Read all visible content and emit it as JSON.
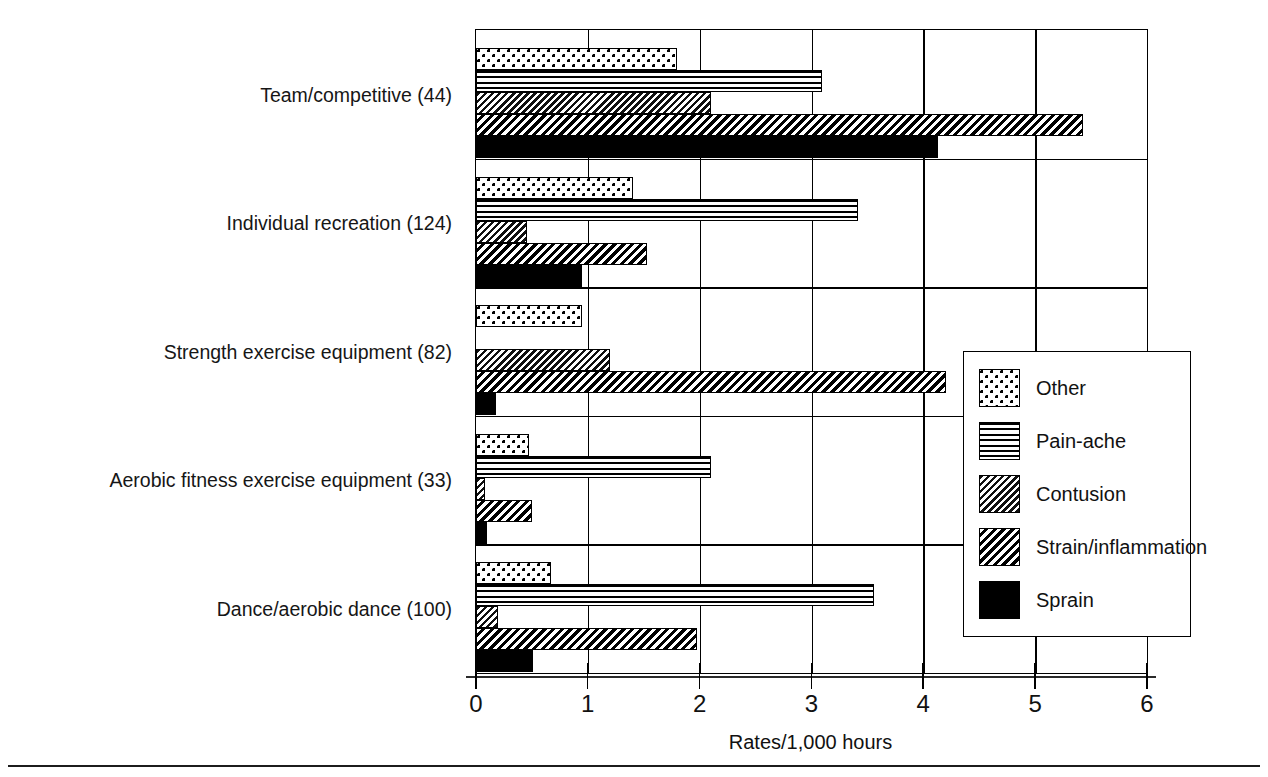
{
  "chart_data": {
    "type": "bar",
    "orientation": "horizontal",
    "title": "",
    "xlabel": "Rates/1,000 hours",
    "ylabel": "",
    "xlim": [
      0,
      6
    ],
    "xticks": [
      "0",
      "1",
      "2",
      "3",
      "4",
      "5",
      "6"
    ],
    "grid": true,
    "legend_position": "right-middle",
    "categories": [
      "Team/competitive (44)",
      "Individual recreation (124)",
      "Strength exercise equipment (82)",
      "Aerobic fitness exercise equipment (33)",
      "Dance/aerobic dance (100)"
    ],
    "series": [
      {
        "name": "Other",
        "pattern": "dots",
        "values": [
          1.8,
          1.4,
          0.95,
          0.47,
          0.67
        ]
      },
      {
        "name": "Pain-ache",
        "pattern": "horizontal-lines",
        "values": [
          3.09,
          3.42,
          0.0,
          2.1,
          3.56
        ]
      },
      {
        "name": "Contusion",
        "pattern": "dark-diagonal",
        "values": [
          2.1,
          0.46,
          1.2,
          0.08,
          0.2
        ]
      },
      {
        "name": "Strain/inflammation",
        "pattern": "light-diagonal",
        "values": [
          5.43,
          1.53,
          4.2,
          0.5,
          1.98
        ]
      },
      {
        "name": "Sprain",
        "pattern": "solid-black",
        "values": [
          4.13,
          0.95,
          0.18,
          0.1,
          0.51
        ]
      }
    ]
  },
  "legend": {
    "items": [
      {
        "label": "Other"
      },
      {
        "label": "Pain-ache"
      },
      {
        "label": "Contusion"
      },
      {
        "label": "Strain/inflammation"
      },
      {
        "label": "Sprain"
      }
    ]
  },
  "axis": {
    "x_label": "Rates/1,000 hours",
    "x_tick_labels": [
      "0",
      "1",
      "2",
      "3",
      "4",
      "5",
      "6"
    ]
  },
  "colors": {
    "ink": "#000000",
    "paper": "#ffffff"
  }
}
